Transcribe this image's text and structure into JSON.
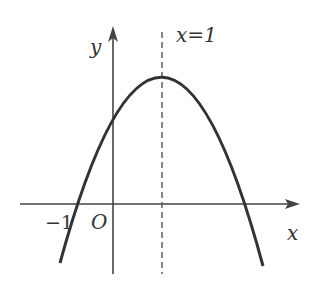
{
  "diagram": {
    "type": "parabola-graph",
    "axes": {
      "x_label": "x",
      "y_label": "y",
      "origin_label": "O"
    },
    "axis_of_symmetry_label": "x=1",
    "tick_labels": [
      "−1"
    ],
    "colors": {
      "curve": "#333333",
      "axes": "#444444",
      "dashed": "#555555",
      "background": "#ffffff"
    }
  }
}
